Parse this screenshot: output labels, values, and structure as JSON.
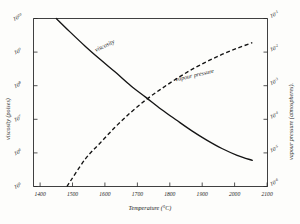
{
  "figure": {
    "title": "",
    "background_color": "#fdfdfb",
    "ink_color": "#141414"
  },
  "chart_data": {
    "type": "line",
    "title": "",
    "subtitle": "",
    "xlabel": "Temperature (°C)",
    "ylabel": "viscosity (poises)",
    "y2label": "vapour pressure (atmospheres)",
    "xlim": [
      1380,
      2150
    ],
    "xscale": "linear",
    "yscale": "log",
    "y2scale": "log",
    "ylim": [
      100000,
      10000000000
    ],
    "y2lim": [
      1e-06,
      0.1
    ],
    "grid": false,
    "legend_position": "inline-annotations",
    "xticks": [
      1400,
      1500,
      1600,
      1700,
      1800,
      1900,
      2000,
      2100
    ],
    "xtick_labels": [
      "1400",
      "1500",
      "1600",
      "1700",
      "1800",
      "1900",
      "2000",
      "2100"
    ],
    "yticks": [
      10000000000,
      1000000000,
      100000000,
      10000000,
      1000000,
      100000
    ],
    "ytick_labels": [
      "10^10",
      "10^9",
      "10^8",
      "10^7",
      "10^6",
      "10^5"
    ],
    "ytick_mantissa": "10",
    "ytick_exponents": [
      "10",
      "9",
      "8",
      "7",
      "6",
      "5"
    ],
    "y2ticks": [
      0.1,
      0.01,
      0.001,
      0.0001,
      1e-05,
      1e-06
    ],
    "y2tick_labels": [
      "10^-1",
      "10^-2",
      "10^-3",
      "10^-4",
      "10^-5",
      "10^-6"
    ],
    "y2tick_exponents": [
      "-1",
      "-2",
      "-3",
      "-4",
      "-5",
      "-6"
    ],
    "series": [
      {
        "name": "viscosity",
        "label": "viscosity",
        "style": "solid",
        "axis": "left",
        "units": "poises",
        "x": [
          1455,
          1500,
          1550,
          1600,
          1650,
          1700,
          1750,
          1800,
          1850,
          1900,
          1950,
          2000,
          2050,
          2100
        ],
        "values": [
          10000000000,
          4000000000,
          1500000000,
          600000000,
          250000000,
          100000000,
          45000000,
          20000000,
          9500000,
          4600000,
          2400000,
          1350000,
          850000,
          600000
        ]
      },
      {
        "name": "vapour pressure",
        "label": "vapour pressure",
        "style": "dashed",
        "axis": "right",
        "units": "atmospheres",
        "x": [
          1490,
          1550,
          1600,
          1650,
          1700,
          1750,
          1800,
          1850,
          1900,
          1950,
          2000,
          2050,
          2100
        ],
        "values": [
          1e-06,
          6.5e-06,
          2e-05,
          6e-05,
          0.00016,
          0.00038,
          0.0008,
          0.0016,
          0.003,
          0.0052,
          0.0085,
          0.013,
          0.019
        ]
      }
    ],
    "annotations": [
      {
        "text": "viscosity",
        "x_px": 96,
        "y_px": 52,
        "rotation": -26
      },
      {
        "text": "vapour pressure",
        "x_px": 195,
        "y_px": 77,
        "rotation": -13
      }
    ]
  },
  "axes": {
    "x_title": "Temperature (°C)",
    "y_left_title": "viscosity (poises)",
    "y_right_title": "vapour pressure (atmospheres)."
  }
}
